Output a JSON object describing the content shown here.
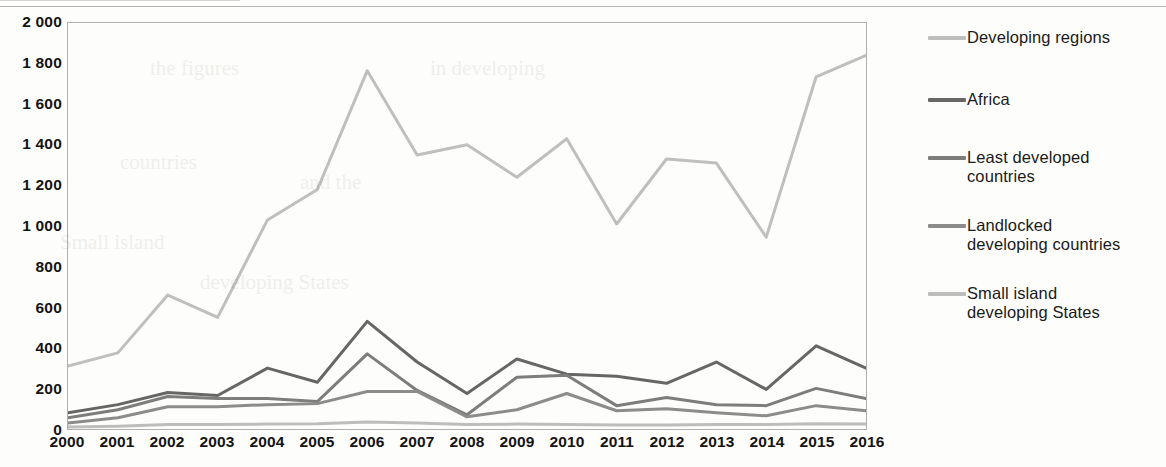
{
  "chart_data": {
    "type": "line",
    "title": "",
    "subtitle": "",
    "xlabel": "",
    "ylabel": "",
    "x": [
      2000,
      2001,
      2002,
      2003,
      2004,
      2005,
      2006,
      2007,
      2008,
      2009,
      2010,
      2011,
      2012,
      2013,
      2014,
      2015,
      2016
    ],
    "xtick_labels": [
      "2000",
      "2001",
      "2002",
      "2003",
      "2004",
      "2005",
      "2006",
      "2007",
      "2008",
      "2009",
      "2010",
      "2011",
      "2012",
      "2013",
      "2014",
      "2015",
      "2016"
    ],
    "ylim": [
      0,
      2000
    ],
    "ytick_values": [
      0,
      200,
      400,
      600,
      800,
      1000,
      1200,
      1400,
      1600,
      1800,
      2000
    ],
    "ytick_labels": [
      "0",
      "200",
      "400",
      "600",
      "800",
      "1 000",
      "1 200",
      "1 400",
      "1 600",
      "1 800",
      "2 000"
    ],
    "grid": false,
    "legend_position": "right",
    "series": [
      {
        "name": "Developing regions",
        "color": "#bfbfbd",
        "values": [
          310,
          375,
          660,
          550,
          1030,
          1180,
          1765,
          1350,
          1400,
          1240,
          1430,
          1010,
          1330,
          1310,
          945,
          1735,
          1840
        ]
      },
      {
        "name": "Africa",
        "color": "#666664",
        "values": [
          80,
          120,
          180,
          165,
          300,
          230,
          530,
          330,
          175,
          345,
          270,
          260,
          225,
          330,
          195,
          410,
          300
        ]
      },
      {
        "name": "Least developed\ncountries",
        "color": "#7d7d7b",
        "values": [
          55,
          95,
          160,
          150,
          150,
          135,
          370,
          190,
          70,
          255,
          265,
          115,
          155,
          120,
          115,
          200,
          150
        ]
      },
      {
        "name": "Landlocked\ndeveloping countries",
        "color": "#8c8c8a",
        "values": [
          30,
          55,
          110,
          110,
          120,
          125,
          185,
          185,
          60,
          95,
          175,
          90,
          100,
          80,
          65,
          115,
          90
        ]
      },
      {
        "name": "Small island\ndeveloping States",
        "color": "#bdbdbb",
        "values": [
          10,
          14,
          22,
          22,
          24,
          26,
          34,
          30,
          22,
          24,
          22,
          20,
          20,
          22,
          22,
          26,
          24
        ]
      }
    ]
  },
  "legend": {
    "entries": [
      {
        "label": "Developing regions"
      },
      {
        "label": "Africa"
      },
      {
        "label": "Least developed\ncountries"
      },
      {
        "label": "Landlocked\ndeveloping countries"
      },
      {
        "label": "Small island\ndeveloping States"
      }
    ]
  },
  "ghost_text": {
    "a": "the figures",
    "b": "in developing",
    "c": "countries",
    "d": "and the",
    "e": "Small island",
    "f": "developing States"
  }
}
